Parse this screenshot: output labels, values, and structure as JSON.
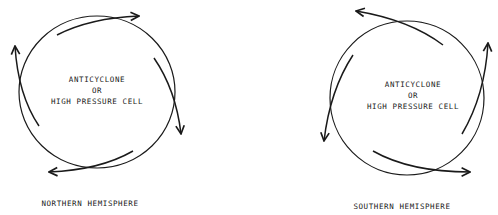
{
  "diagram": {
    "panels": [
      {
        "id": "northern",
        "caption": "NORTHERN HEMISPHERE",
        "center_text": [
          "ANTICYCLONE",
          "OR",
          "HIGH PRESSURE CELL"
        ],
        "circulation": "clockwise"
      },
      {
        "id": "southern",
        "caption": "SOUTHERN HEMISPHERE",
        "center_text": [
          "ANTICYCLONE",
          "OR",
          "HIGH PRESSURE CELL"
        ],
        "circulation": "counterclockwise"
      }
    ],
    "colors": {
      "line": "#1a1a1a",
      "background": "#ffffff"
    }
  }
}
